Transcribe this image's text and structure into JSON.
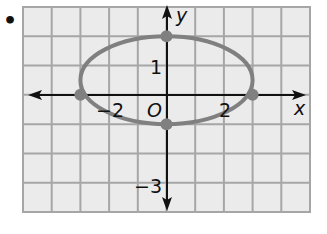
{
  "bullet": "•",
  "chart_data": {
    "type": "line",
    "title": "",
    "xlabel": "x",
    "ylabel": "y",
    "xlim": [
      -5,
      5
    ],
    "ylim": [
      -4,
      3
    ],
    "grid": true,
    "origin_label": "O",
    "x_tick_labels": [
      {
        "value": -2,
        "text": "−2"
      },
      {
        "value": 2,
        "text": "2"
      }
    ],
    "y_tick_labels": [
      {
        "value": 1,
        "text": "1"
      },
      {
        "value": -3,
        "text": "−3"
      }
    ],
    "series": [
      {
        "name": "ellipse",
        "shape": "ellipse",
        "center": [
          0,
          0.5
        ],
        "semi_axis_x": 3,
        "semi_axis_y": 1.5,
        "color": "#808080"
      }
    ],
    "points": [
      {
        "x": -3,
        "y": 0
      },
      {
        "x": 3,
        "y": 0
      },
      {
        "x": 0,
        "y": 2
      },
      {
        "x": 0,
        "y": -1
      }
    ]
  },
  "colors": {
    "grid": "#a6a6a6",
    "background": "#ebebeb",
    "curve": "#808080",
    "axis": "#111111"
  }
}
